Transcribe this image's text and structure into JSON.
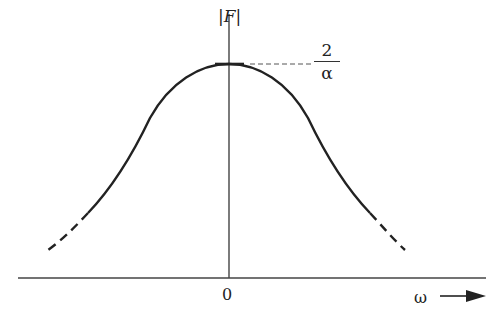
{
  "diagram": {
    "y_axis_label": "|F|",
    "x_axis_label": "ω",
    "origin_label": "0",
    "peak_annotation": {
      "numerator": "2",
      "denominator": "α"
    },
    "colors": {
      "line": "#222222",
      "background": "#ffffff"
    }
  }
}
